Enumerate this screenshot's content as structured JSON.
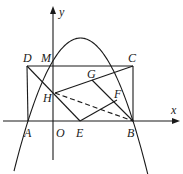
{
  "figure": {
    "type": "coordinate-geometry-diagram",
    "axes": {
      "x_label": "x",
      "y_label": "y",
      "origin_label": "O"
    },
    "points": [
      {
        "name": "A",
        "x": 28,
        "y": 121,
        "lx": 24,
        "ly": 137
      },
      {
        "name": "O",
        "x": 53,
        "y": 121,
        "lx": 56,
        "ly": 137
      },
      {
        "name": "E",
        "x": 80,
        "y": 121,
        "lx": 76,
        "ly": 137
      },
      {
        "name": "B",
        "x": 133,
        "y": 121,
        "lx": 127,
        "ly": 137
      },
      {
        "name": "D",
        "x": 27,
        "y": 66,
        "lx": 23,
        "ly": 62
      },
      {
        "name": "M",
        "x": 53,
        "y": 66,
        "lx": 41,
        "ly": 62
      },
      {
        "name": "C",
        "x": 133,
        "y": 66,
        "lx": 128,
        "ly": 62
      },
      {
        "name": "G",
        "x": 92,
        "y": 80,
        "lx": 87,
        "ly": 78
      },
      {
        "name": "H",
        "x": 55,
        "y": 93,
        "lx": 43,
        "ly": 102
      },
      {
        "name": "F",
        "x": 117,
        "y": 100,
        "lx": 114,
        "ly": 98
      }
    ],
    "segments": [
      {
        "from": "D",
        "to": "C",
        "style": "solid"
      },
      {
        "from": "D",
        "to": "A",
        "style": "solid"
      },
      {
        "from": "C",
        "to": "B",
        "style": "solid"
      },
      {
        "from": "D",
        "to": "E",
        "style": "solid"
      },
      {
        "from": "H",
        "to": "C",
        "style": "solid"
      },
      {
        "from": "G",
        "to": "B",
        "style": "solid"
      },
      {
        "from": "E",
        "to": "F",
        "style": "solid"
      },
      {
        "from": "H",
        "to": "B",
        "style": "dashed"
      }
    ],
    "curve": {
      "kind": "parabola",
      "opens": "down",
      "passes_through": [
        "A",
        "M",
        "B"
      ]
    }
  }
}
